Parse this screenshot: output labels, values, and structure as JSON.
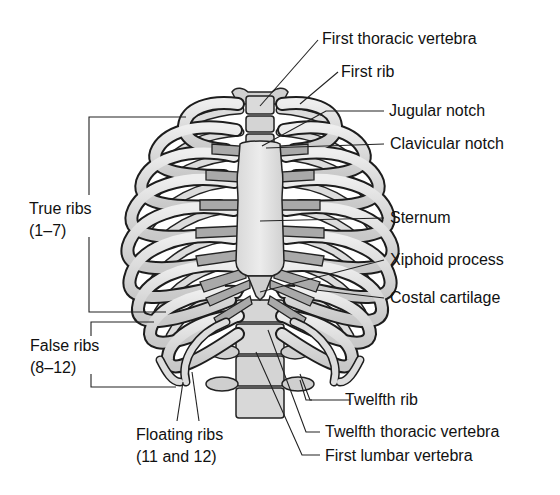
{
  "diagram": {
    "colors": {
      "background": "#ffffff",
      "bone": "#d6d6d6",
      "bone_light": "#e6e6e6",
      "cartilage": "#a9a9a9",
      "outline": "#222222",
      "text": "#111111"
    },
    "labels_right": [
      {
        "id": "first-thoracic-vertebra",
        "text": "First thoracic vertebra"
      },
      {
        "id": "first-rib",
        "text": "First rib"
      },
      {
        "id": "jugular-notch",
        "text": "Jugular notch"
      },
      {
        "id": "clavicular-notch",
        "text": "Clavicular notch"
      },
      {
        "id": "sternum",
        "text": "Sternum"
      },
      {
        "id": "xiphoid-process",
        "text": "Xiphoid process"
      },
      {
        "id": "costal-cartilage",
        "text": "Costal cartilage"
      },
      {
        "id": "twelfth-rib",
        "text": "Twelfth rib"
      },
      {
        "id": "twelfth-thoracic-vertebra",
        "text": "Twelfth thoracic vertebra"
      },
      {
        "id": "first-lumbar-vertebra",
        "text": "First lumbar vertebra"
      }
    ],
    "labels_left": [
      {
        "id": "true-ribs",
        "line1": "True ribs",
        "line2": "(1–7)"
      },
      {
        "id": "false-ribs",
        "line1": "False ribs",
        "line2": "(8–12)"
      }
    ],
    "labels_bottom": [
      {
        "id": "floating-ribs",
        "line1": "Floating ribs",
        "line2": "(11 and 12)"
      }
    ]
  }
}
